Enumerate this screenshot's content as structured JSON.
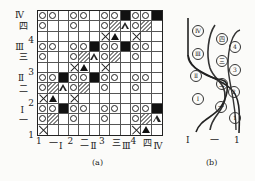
{
  "figure_a": {
    "caption": "(a)",
    "left_labels": [
      {
        "text": "Ⅳ",
        "row": 0
      },
      {
        "text": "四",
        "row": 1
      },
      {
        "text": "4",
        "row": 2
      },
      {
        "text": "Ⅲ",
        "row": 3
      },
      {
        "text": "三",
        "row": 4
      },
      {
        "text": "3",
        "row": 5
      },
      {
        "text": "Ⅱ",
        "row": 6
      },
      {
        "text": "二",
        "row": 7
      },
      {
        "text": "2",
        "row": 8
      },
      {
        "text": "Ⅰ",
        "row": 9
      },
      {
        "text": "一",
        "row": 10
      },
      {
        "text": "1",
        "row": 11
      }
    ],
    "bottom_labels": [
      "1",
      "一",
      "Ⅰ",
      "2",
      "二",
      "Ⅱ",
      "3",
      "三",
      "Ⅲ",
      "4",
      "四",
      "Ⅳ"
    ],
    "legend": {
      "o": "circle",
      "b": "black-square",
      "h": "hatched",
      "t": "white-triangle",
      "T": "black-triangle",
      "x": "cross",
      "_": "empty"
    },
    "grid": [
      "oo_oo_oob oob",
      "o__o__oht oh_",
      "______xT_x__",
      "oo_oobo ob oo_",
      "o__oht oh_o__",
      "___xT_x_____",
      "oobo ob oo_oo_",
      "ohtoh_o__o__",
      "xT_x________",
      "oobo o_oo_oob",
      "oh_o__o__oht",
      "x________xT_"
    ],
    "rows": [
      [
        "o",
        "o",
        "_",
        "o",
        "o",
        "_",
        "o",
        "o",
        "b",
        "o",
        "o",
        "b"
      ],
      [
        "o",
        "_",
        "_",
        "o",
        "_",
        "_",
        "o",
        "h",
        "t",
        "o",
        "h",
        "_"
      ],
      [
        "_",
        "_",
        "_",
        "_",
        "_",
        "_",
        "x",
        "T",
        "_",
        "x",
        "_",
        "_"
      ],
      [
        "o",
        "o",
        "_",
        "o",
        "o",
        "b",
        "o",
        "o",
        "b",
        "o",
        "o",
        "_"
      ],
      [
        "o",
        "_",
        "_",
        "o",
        "h",
        "t",
        "o",
        "h",
        "_",
        "o",
        "_",
        "_"
      ],
      [
        "_",
        "_",
        "_",
        "x",
        "T",
        "_",
        "x",
        "_",
        "_",
        "_",
        "_",
        "_"
      ],
      [
        "o",
        "o",
        "b",
        "o",
        "o",
        "b",
        "o",
        "o",
        "_",
        "o",
        "o",
        "_"
      ],
      [
        "o",
        "h",
        "t",
        "o",
        "h",
        "_",
        "o",
        "_",
        "_",
        "o",
        "_",
        "_"
      ],
      [
        "x",
        "T",
        "_",
        "x",
        "_",
        "_",
        "_",
        "_",
        "_",
        "_",
        "_",
        "_"
      ],
      [
        "o",
        "o",
        "b",
        "o",
        "o",
        "_",
        "o",
        "o",
        "_",
        "o",
        "o",
        "b"
      ],
      [
        "o",
        "h",
        "_",
        "o",
        "_",
        "_",
        "o",
        "_",
        "_",
        "o",
        "h",
        "t"
      ],
      [
        "x",
        "_",
        "_",
        "_",
        "_",
        "_",
        "_",
        "_",
        "_",
        "x",
        "T",
        "_"
      ]
    ]
  },
  "figure_b": {
    "caption": "(b)",
    "bottom_labels": [
      "Ⅰ",
      "一",
      "1"
    ],
    "circled_labels": [
      {
        "text": "Ⅳ",
        "x": 197,
        "y": 30
      },
      {
        "text": "Ⅲ",
        "x": 197,
        "y": 53
      },
      {
        "text": "Ⅱ",
        "x": 195,
        "y": 75
      },
      {
        "text": "Ⅰ",
        "x": 197,
        "y": 98
      },
      {
        "text": "四",
        "x": 221,
        "y": 38
      },
      {
        "text": "三",
        "x": 221,
        "y": 60
      },
      {
        "text": "二",
        "x": 221,
        "y": 83
      },
      {
        "text": "一",
        "x": 220,
        "y": 106
      },
      {
        "text": "4",
        "x": 234,
        "y": 46
      },
      {
        "text": "3",
        "x": 234,
        "y": 69
      },
      {
        "text": "2",
        "x": 233,
        "y": 91
      },
      {
        "text": "1",
        "x": 234,
        "y": 117
      }
    ]
  }
}
